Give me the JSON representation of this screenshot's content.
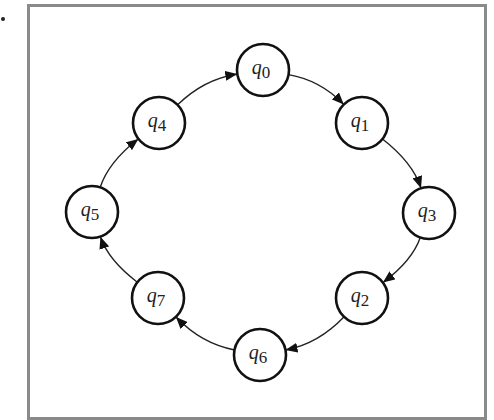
{
  "figure": {
    "bullet": "•",
    "frame_color": "#8a8a8a",
    "node_stroke": "#111111",
    "edge_color": "#222222",
    "node_radius": 26,
    "nodes": [
      {
        "id": "q0",
        "base": "q",
        "sub": "0",
        "x": 263,
        "y": 70
      },
      {
        "id": "q1",
        "base": "q",
        "sub": "1",
        "x": 362,
        "y": 123
      },
      {
        "id": "q3",
        "base": "q",
        "sub": "3",
        "x": 429,
        "y": 213
      },
      {
        "id": "q2",
        "base": "q",
        "sub": "2",
        "x": 362,
        "y": 298
      },
      {
        "id": "q6",
        "base": "q",
        "sub": "6",
        "x": 260,
        "y": 355
      },
      {
        "id": "q7",
        "base": "q",
        "sub": "7",
        "x": 158,
        "y": 298
      },
      {
        "id": "q5",
        "base": "q",
        "sub": "5",
        "x": 92,
        "y": 212
      },
      {
        "id": "q4",
        "base": "q",
        "sub": "4",
        "x": 159,
        "y": 123
      }
    ],
    "edges": [
      {
        "from": "q0",
        "to": "q1"
      },
      {
        "from": "q1",
        "to": "q3"
      },
      {
        "from": "q3",
        "to": "q2"
      },
      {
        "from": "q2",
        "to": "q6"
      },
      {
        "from": "q6",
        "to": "q7"
      },
      {
        "from": "q7",
        "to": "q5"
      },
      {
        "from": "q5",
        "to": "q4"
      },
      {
        "from": "q4",
        "to": "q0"
      }
    ]
  }
}
